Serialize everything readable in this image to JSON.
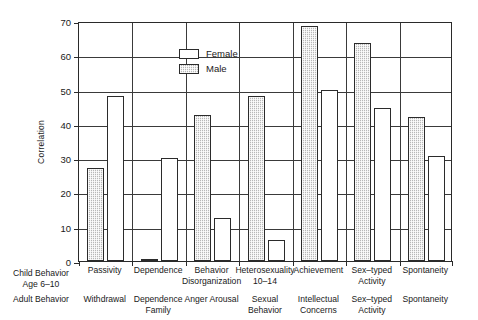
{
  "legend": {
    "position": "top-left-inside",
    "entries": [
      {
        "label": "Female",
        "swatch": "white-open-square",
        "color": "#ffffff"
      },
      {
        "label": "Male",
        "swatch": "gray-hatched-square",
        "color": "#b8b8b8"
      }
    ]
  },
  "axis": {
    "ylabel": "Correlation",
    "yticks": [
      "0",
      "10",
      "20",
      "30",
      "40",
      "50",
      "60",
      "70"
    ]
  },
  "row_headers": {
    "child": "Child Behavior\nAge 6–10",
    "adult": "Adult Behavior"
  },
  "chart_data": {
    "type": "bar",
    "title": "",
    "xlabel": "",
    "ylabel": "Correlation",
    "ylim": [
      0,
      70
    ],
    "yticks": [
      0,
      10,
      20,
      30,
      40,
      50,
      60,
      70
    ],
    "grid": true,
    "legend_position": "upper left (inside axes)",
    "categories": [
      "Passivity",
      "Dependence",
      "Behavior\nDisorganization",
      "Heterosexuality\n10–14",
      "Achievement",
      "Sex–typed\nActivity",
      "Spontaneity"
    ],
    "adult_categories": [
      "Withdrawal",
      "Dependence\nFamily",
      "Anger Arousal",
      "Sexual\nBehavior",
      "Intellectual\nConcerns",
      "Sex–typed\nActivity",
      "Spontaneity"
    ],
    "series": [
      {
        "name": "Male",
        "color": "#b8b8b8",
        "values": [
          27,
          0.5,
          42.5,
          48,
          68.5,
          63.5,
          42
        ]
      },
      {
        "name": "Female",
        "color": "#ffffff",
        "values": [
          48,
          30,
          12.5,
          6,
          50,
          44.5,
          30.5
        ]
      }
    ]
  }
}
